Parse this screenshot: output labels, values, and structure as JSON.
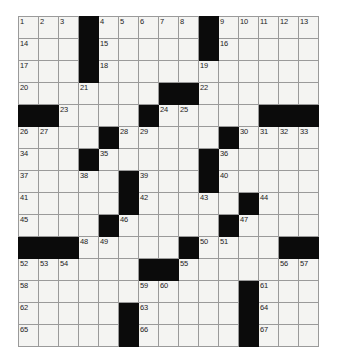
{
  "puzzle": {
    "type": "crossword-grid",
    "rows": 15,
    "cols": 15,
    "cell_size_px": 22,
    "colors": {
      "block": "#0b0b0b",
      "cell": "#f4f4f2",
      "grid_line": "#9a9a9a",
      "border": "#6d6d6d",
      "number_text": "#1b1b1b",
      "page_background": "#ffffff"
    },
    "blocks": [
      [
        0,
        3
      ],
      [
        0,
        9
      ],
      [
        1,
        3
      ],
      [
        1,
        9
      ],
      [
        2,
        3
      ],
      [
        3,
        7
      ],
      [
        3,
        8
      ],
      [
        4,
        0
      ],
      [
        4,
        1
      ],
      [
        4,
        6
      ],
      [
        4,
        12
      ],
      [
        4,
        13
      ],
      [
        4,
        14
      ],
      [
        5,
        4
      ],
      [
        5,
        10
      ],
      [
        6,
        3
      ],
      [
        6,
        9
      ],
      [
        7,
        5
      ],
      [
        7,
        9
      ],
      [
        8,
        5
      ],
      [
        8,
        11
      ],
      [
        9,
        4
      ],
      [
        9,
        10
      ],
      [
        10,
        0
      ],
      [
        10,
        1
      ],
      [
        10,
        2
      ],
      [
        10,
        8
      ],
      [
        10,
        13
      ],
      [
        10,
        14
      ],
      [
        11,
        6
      ],
      [
        11,
        7
      ],
      [
        12,
        11
      ],
      [
        13,
        5
      ],
      [
        13,
        11
      ],
      [
        14,
        5
      ],
      [
        14,
        11
      ]
    ],
    "numbers": [
      {
        "r": 0,
        "c": 0,
        "n": "1"
      },
      {
        "r": 0,
        "c": 1,
        "n": "2"
      },
      {
        "r": 0,
        "c": 2,
        "n": "3"
      },
      {
        "r": 0,
        "c": 4,
        "n": "4"
      },
      {
        "r": 0,
        "c": 5,
        "n": "5"
      },
      {
        "r": 0,
        "c": 6,
        "n": "6"
      },
      {
        "r": 0,
        "c": 7,
        "n": "7"
      },
      {
        "r": 0,
        "c": 8,
        "n": "8"
      },
      {
        "r": 0,
        "c": 10,
        "n": "9"
      },
      {
        "r": 0,
        "c": 11,
        "n": "10"
      },
      {
        "r": 0,
        "c": 12,
        "n": "11"
      },
      {
        "r": 0,
        "c": 13,
        "n": "12"
      },
      {
        "r": 0,
        "c": 14,
        "n": "13"
      },
      {
        "r": 1,
        "c": 0,
        "n": "14"
      },
      {
        "r": 1,
        "c": 4,
        "n": "15"
      },
      {
        "r": 1,
        "c": 10,
        "n": "16"
      },
      {
        "r": 2,
        "c": 0,
        "n": "17"
      },
      {
        "r": 2,
        "c": 4,
        "n": "18"
      },
      {
        "r": 2,
        "c": 9,
        "n": "19"
      },
      {
        "r": 3,
        "c": 0,
        "n": "20"
      },
      {
        "r": 3,
        "c": 3,
        "n": "21"
      },
      {
        "r": 3,
        "c": 9,
        "n": "22"
      },
      {
        "r": 4,
        "c": 2,
        "n": "23"
      },
      {
        "r": 4,
        "c": 7,
        "n": "24"
      },
      {
        "r": 4,
        "c": 8,
        "n": "25"
      },
      {
        "r": 5,
        "c": 0,
        "n": "26"
      },
      {
        "r": 5,
        "c": 1,
        "n": "27"
      },
      {
        "r": 5,
        "c": 5,
        "n": "28"
      },
      {
        "r": 5,
        "c": 6,
        "n": "29"
      },
      {
        "r": 5,
        "c": 11,
        "n": "30"
      },
      {
        "r": 5,
        "c": 12,
        "n": "31"
      },
      {
        "r": 5,
        "c": 13,
        "n": "32"
      },
      {
        "r": 5,
        "c": 14,
        "n": "33"
      },
      {
        "r": 6,
        "c": 0,
        "n": "34"
      },
      {
        "r": 6,
        "c": 4,
        "n": "35"
      },
      {
        "r": 6,
        "c": 10,
        "n": "36"
      },
      {
        "r": 7,
        "c": 0,
        "n": "37"
      },
      {
        "r": 7,
        "c": 3,
        "n": "38"
      },
      {
        "r": 7,
        "c": 6,
        "n": "39"
      },
      {
        "r": 7,
        "c": 10,
        "n": "40"
      },
      {
        "r": 8,
        "c": 0,
        "n": "41"
      },
      {
        "r": 8,
        "c": 6,
        "n": "42"
      },
      {
        "r": 8,
        "c": 9,
        "n": "43"
      },
      {
        "r": 8,
        "c": 12,
        "n": "44"
      },
      {
        "r": 9,
        "c": 0,
        "n": "45"
      },
      {
        "r": 9,
        "c": 5,
        "n": "46"
      },
      {
        "r": 9,
        "c": 11,
        "n": "47"
      },
      {
        "r": 10,
        "c": 3,
        "n": "48"
      },
      {
        "r": 10,
        "c": 4,
        "n": "49"
      },
      {
        "r": 10,
        "c": 9,
        "n": "50"
      },
      {
        "r": 10,
        "c": 10,
        "n": "51"
      },
      {
        "r": 11,
        "c": 0,
        "n": "52"
      },
      {
        "r": 11,
        "c": 1,
        "n": "53"
      },
      {
        "r": 11,
        "c": 2,
        "n": "54"
      },
      {
        "r": 11,
        "c": 8,
        "n": "55"
      },
      {
        "r": 11,
        "c": 13,
        "n": "56"
      },
      {
        "r": 11,
        "c": 14,
        "n": "57"
      },
      {
        "r": 12,
        "c": 0,
        "n": "58"
      },
      {
        "r": 12,
        "c": 6,
        "n": "59"
      },
      {
        "r": 12,
        "c": 7,
        "n": "60"
      },
      {
        "r": 12,
        "c": 12,
        "n": "61"
      },
      {
        "r": 13,
        "c": 0,
        "n": "62"
      },
      {
        "r": 13,
        "c": 6,
        "n": "63"
      },
      {
        "r": 13,
        "c": 12,
        "n": "64"
      },
      {
        "r": 14,
        "c": 0,
        "n": "65"
      },
      {
        "r": 14,
        "c": 6,
        "n": "66"
      },
      {
        "r": 14,
        "c": 12,
        "n": "67"
      }
    ]
  }
}
